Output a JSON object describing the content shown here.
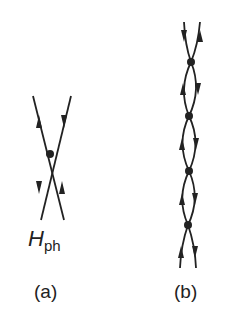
{
  "diagram_a": {
    "label": "(a)",
    "operator": {
      "symbol": "H",
      "subscript": "ph"
    },
    "vertex": [
      50,
      154
    ],
    "lines": [
      {
        "from": [
          33,
          96
        ],
        "to": [
          64,
          220
        ]
      },
      {
        "from": [
          71,
          96
        ],
        "to": [
          41,
          220
        ]
      }
    ],
    "arrows": [
      {
        "at": [
          39,
          121
        ],
        "dir": "up"
      },
      {
        "at": [
          64,
          121
        ],
        "dir": "down"
      },
      {
        "at": [
          39,
          187
        ],
        "dir": "down"
      },
      {
        "at": [
          62,
          187
        ],
        "dir": "up"
      }
    ]
  },
  "diagram_b": {
    "label": "(b)",
    "vertices": [
      [
        191,
        62
      ],
      [
        189,
        116
      ],
      [
        189,
        171
      ],
      [
        188,
        225
      ]
    ],
    "arrows_description": "alternating directed fermion loops between successive vertices"
  },
  "colors": {
    "line": "#222222",
    "background": "#ffffff"
  }
}
